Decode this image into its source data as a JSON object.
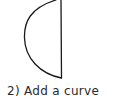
{
  "step": {
    "number": "2)",
    "caption": "2) Add a curve"
  },
  "shape": {
    "description": "half-moon shape: straight vertical line with curve on left",
    "stroke_color": "#1a1a1a"
  }
}
